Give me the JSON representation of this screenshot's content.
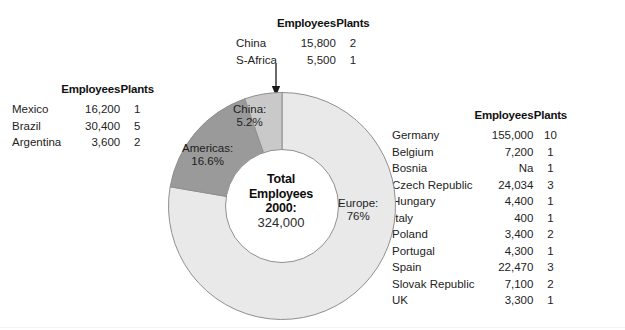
{
  "chart_data": {
    "type": "pie",
    "title": "Total Employees 2000",
    "center_label_lines": [
      "Total",
      "Employees",
      "2000:"
    ],
    "center_value": "324,000",
    "categories": [
      "Europe",
      "Americas",
      "China"
    ],
    "values": [
      76,
      16.6,
      5.2
    ],
    "labels": [
      "Europe: 76%",
      "Americas: 16.6%",
      "China: 5.2%"
    ],
    "colors": [
      "#e9e9e9",
      "#9a9a9a",
      "#c9c9c9"
    ],
    "donut": true,
    "start_angle_deg": 0,
    "direction": "clockwise",
    "legend": "none",
    "annotation": "arrow pointing to China slice from the China / S-Africa table",
    "slices": [
      {
        "name": "Europe",
        "percent": 76,
        "label": "Europe:",
        "value_label": "76%",
        "color": "#e9e9e9"
      },
      {
        "name": "Americas",
        "percent": 16.6,
        "label": "Americas:",
        "value_label": "16.6%",
        "color": "#9a9a9a"
      },
      {
        "name": "China",
        "percent": 5.2,
        "label": "China:",
        "value_label": "5.2%",
        "color": "#c9c9c9"
      }
    ]
  },
  "tables": {
    "headers": {
      "name": "",
      "employees": "Employees",
      "plants": "Plants"
    },
    "top": {
      "rows": [
        {
          "name": "China",
          "employees": "15,800",
          "plants": "2"
        },
        {
          "name": "S-Africa",
          "employees": "5,500",
          "plants": "1"
        }
      ]
    },
    "left": {
      "rows": [
        {
          "name": "Mexico",
          "employees": "16,200",
          "plants": "1"
        },
        {
          "name": "Brazil",
          "employees": "30,400",
          "plants": "5"
        },
        {
          "name": "Argentina",
          "employees": "3,600",
          "plants": "2"
        }
      ]
    },
    "right": {
      "rows": [
        {
          "name": "Germany",
          "employees": "155,000",
          "plants": "10"
        },
        {
          "name": "Belgium",
          "employees": "7,200",
          "plants": "1"
        },
        {
          "name": "Bosnia",
          "employees": "Na",
          "plants": "1"
        },
        {
          "name": "Czech Republic",
          "employees": "24,034",
          "plants": "3"
        },
        {
          "name": "Hungary",
          "employees": "4,400",
          "plants": "1"
        },
        {
          "name": "Italy",
          "employees": "400",
          "plants": "1"
        },
        {
          "name": "Poland",
          "employees": "3,400",
          "plants": "2"
        },
        {
          "name": "Portugal",
          "employees": "4,300",
          "plants": "1"
        },
        {
          "name": "Spain",
          "employees": "22,470",
          "plants": "3"
        },
        {
          "name": "Slovak Republic",
          "employees": "7,100",
          "plants": "2"
        },
        {
          "name": "UK",
          "employees": "3,300",
          "plants": "1"
        }
      ]
    }
  },
  "icons": {
    "down-arrow": "arrow pointing down to China slice"
  }
}
